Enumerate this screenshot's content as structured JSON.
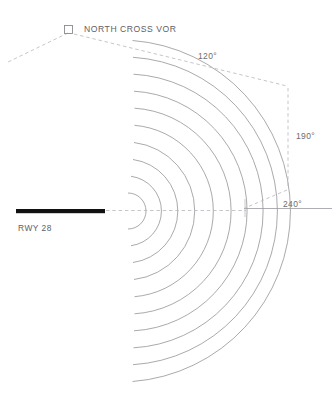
{
  "diagram": {
    "background_color": "#ffffff"
  },
  "navaid": {
    "label": "NORTH CROSS VOR",
    "symbol_name": "vor-square-icon",
    "symbol_color": "#8a8a8f"
  },
  "runway": {
    "label": "RWY 28",
    "color": "#111111"
  },
  "radials": {
    "start_label": "120°",
    "mid_label": "190°",
    "end_label": "240°",
    "line_color": "#b4b4b9",
    "style": "dashed"
  },
  "arcs": {
    "count": 10,
    "color": "#8e8e93",
    "center_x": 128,
    "center_y": 211,
    "radii": [
      18,
      35,
      52,
      69,
      86,
      103,
      120,
      137,
      154,
      171
    ]
  },
  "centerline": {
    "color": "#b4b4b9",
    "solid_color": "#9a9aa0"
  }
}
